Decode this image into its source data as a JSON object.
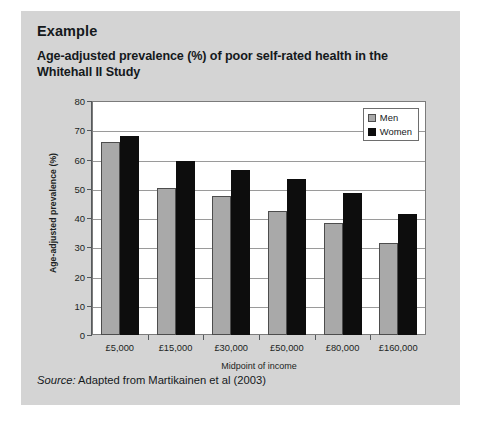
{
  "panel": {
    "example_heading": "Example",
    "chart_title": "Age-adjusted prevalence (%) of poor self-rated health in the Whitehall II Study",
    "source_prefix": "Source:",
    "source_text": " Adapted from Martikainen et al (2003)"
  },
  "colors": {
    "panel_background": "#d4d4d4",
    "page_background": "#ffffff",
    "plot_background": "#ffffff",
    "men_bar": "#a9a9a9",
    "women_bar": "#0d0d0d",
    "gridline": "#9a9a9a",
    "axis": "#55595c",
    "text": "#15191c"
  },
  "chart_data": {
    "type": "bar",
    "title": "Age-adjusted prevalence (%) of poor self-rated health in the Whitehall II Study",
    "xlabel": "Midpoint of income",
    "ylabel": "Age-adjusted prevalence (%)",
    "ylim": [
      0,
      80
    ],
    "ytick_values": [
      0,
      10,
      20,
      30,
      40,
      50,
      60,
      70,
      80
    ],
    "ytick_labels": [
      "0",
      "10",
      "20",
      "30",
      "40",
      "50",
      "60",
      "70",
      "80"
    ],
    "grid": true,
    "legend_position": "top-right inside plot",
    "categories": [
      "£5,000",
      "£15,000",
      "£30,000",
      "£50,000",
      "£80,000",
      "£160,000"
    ],
    "series": [
      {
        "name": "Men",
        "color": "#a9a9a9",
        "values": [
          66.0,
          50.2,
          47.5,
          42.5,
          38.2,
          31.5
        ]
      },
      {
        "name": "Women",
        "color": "#0d0d0d",
        "values": [
          68.0,
          59.5,
          56.5,
          53.5,
          48.5,
          41.5
        ]
      }
    ]
  }
}
